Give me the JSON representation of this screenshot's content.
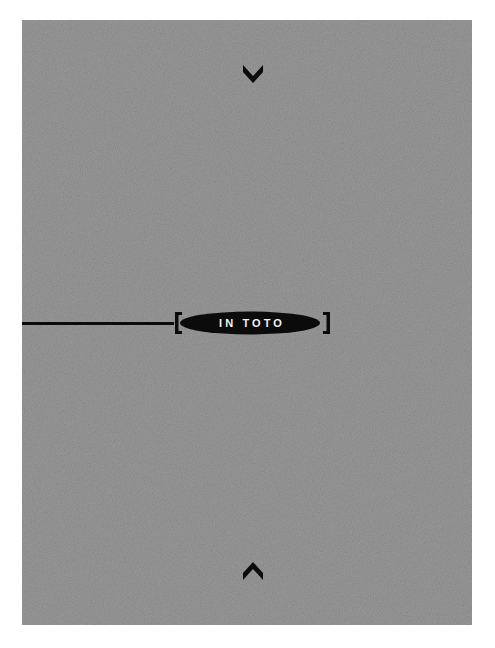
{
  "canvas": {
    "width": 495,
    "height": 648,
    "background": "#ffffff"
  },
  "plate": {
    "x": 22,
    "y": 20,
    "width": 450,
    "height": 605,
    "fill": "#9a9a9a",
    "texture": "film-grain"
  },
  "artwork": {
    "ink_color": "#0b0b0b",
    "label_color": "#f2f2f2",
    "title": "IN TOTO",
    "rule": {
      "y": 303,
      "x_start": 0,
      "x_end": 150,
      "thickness": 3
    },
    "badge": {
      "label": "IN TOTO",
      "center_x": 228,
      "center_y": 303,
      "rx": 70,
      "ry": 11
    },
    "bracket_left": {
      "x": 155,
      "y": 303
    },
    "bracket_right": {
      "x": 304,
      "y": 303
    },
    "chevron_top": {
      "name": "chevron-down",
      "center_x": 231,
      "center_y": 52,
      "width": 20,
      "height": 14
    },
    "chevron_bottom": {
      "name": "chevron-up",
      "center_x": 231,
      "center_y": 553,
      "width": 20,
      "height": 14
    }
  }
}
